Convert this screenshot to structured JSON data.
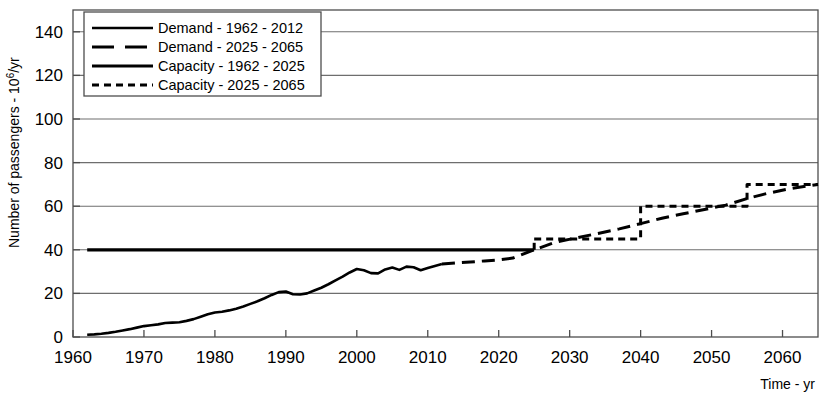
{
  "chart_data": {
    "type": "line",
    "title": "",
    "xlabel": "Time - yr",
    "ylabel": "Number of passengers - 10^6/yr",
    "ylabel_main": "Number of passengers - 10",
    "ylabel_exp": "6",
    "ylabel_tail": "/yr",
    "xlim": [
      1960,
      2065
    ],
    "ylim": [
      0,
      150
    ],
    "grid": true,
    "xticks": [
      1960,
      1970,
      1980,
      1990,
      2000,
      2010,
      2020,
      2030,
      2040,
      2050,
      2060
    ],
    "yticks": [
      0,
      20,
      40,
      60,
      80,
      100,
      120,
      140
    ],
    "legend_position": "top-left",
    "series": [
      {
        "name": "Demand - 1962 - 2012",
        "style": "solid-thin",
        "x": [
          1962,
          1963,
          1964,
          1965,
          1966,
          1967,
          1968,
          1969,
          1970,
          1971,
          1972,
          1973,
          1974,
          1975,
          1976,
          1977,
          1978,
          1979,
          1980,
          1981,
          1982,
          1983,
          1984,
          1985,
          1986,
          1987,
          1988,
          1989,
          1990,
          1991,
          1992,
          1993,
          1994,
          1995,
          1996,
          1997,
          1998,
          1999,
          2000,
          2001,
          2002,
          2003,
          2004,
          2005,
          2006,
          2007,
          2008,
          2009,
          2010,
          2011,
          2012
        ],
        "values": [
          1.0,
          1.2,
          1.5,
          1.9,
          2.4,
          3.0,
          3.6,
          4.3,
          5.0,
          5.4,
          5.8,
          6.4,
          6.6,
          6.8,
          7.4,
          8.2,
          9.3,
          10.4,
          11.2,
          11.6,
          12.2,
          13.0,
          14.0,
          15.2,
          16.4,
          17.8,
          19.3,
          20.6,
          20.9,
          19.6,
          19.5,
          20.0,
          21.3,
          22.6,
          24.2,
          26.0,
          27.7,
          29.6,
          31.2,
          30.6,
          29.3,
          29.2,
          31.0,
          31.9,
          30.8,
          32.3,
          32.0,
          30.6,
          31.6,
          32.6,
          33.5
        ]
      },
      {
        "name": "Demand - 2025 - 2065",
        "style": "dashed-long",
        "x": [
          2012,
          2014,
          2016,
          2018,
          2020,
          2022,
          2025,
          2028,
          2031,
          2034,
          2037,
          2040,
          2043,
          2046,
          2049,
          2052,
          2055,
          2058,
          2061,
          2065
        ],
        "values": [
          33.5,
          34.0,
          34.4,
          34.9,
          35.4,
          36.2,
          40.0,
          43.5,
          45.5,
          47.5,
          49.6,
          52.0,
          54.5,
          56.5,
          58.5,
          60.5,
          63.5,
          66.0,
          68.0,
          70.0
        ]
      },
      {
        "name": "Capacity - 1962 - 2025",
        "style": "solid-thick",
        "x": [
          1962,
          2025
        ],
        "values": [
          40,
          40
        ]
      },
      {
        "name": "Capacity - 2025 - 2065",
        "style": "dashed-short",
        "steps": [
          {
            "from": 2025,
            "to": 2040,
            "value": 45
          },
          {
            "from": 2040,
            "to": 2055,
            "value": 60
          },
          {
            "from": 2055,
            "to": 2065,
            "value": 70
          }
        ],
        "x": [
          2025,
          2040,
          2040,
          2055,
          2055,
          2065
        ],
        "values": [
          45,
          45,
          60,
          60,
          70,
          70
        ]
      }
    ]
  },
  "legend": {
    "items": [
      {
        "label": "Demand - 1962 - 2012",
        "style": "solid-thin"
      },
      {
        "label": "Demand - 2025 - 2065",
        "style": "dashed-long"
      },
      {
        "label": "Capacity - 1962 - 2025",
        "style": "solid-thick"
      },
      {
        "label": "Capacity - 2025 - 2065",
        "style": "dashed-short"
      }
    ]
  },
  "colors": {
    "line": "#000000",
    "grid": "#6e6e6e",
    "axis": "#4d4d4d",
    "background": "#ffffff"
  }
}
